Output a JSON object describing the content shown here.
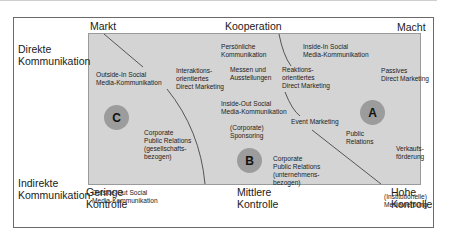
{
  "axes": {
    "top": [
      "Markt",
      "Kooperation",
      "Macht"
    ],
    "left": [
      "Direkte Kommunikation",
      "Indirekte Kommunikation"
    ],
    "bottom": [
      "Geringe Kontrolle",
      "Mittlere Kontrolle",
      "Hohe Kontrolle"
    ]
  },
  "clusters": [
    {
      "label": "C",
      "color": "#9c9c9c"
    },
    {
      "label": "B",
      "color": "#9c9c9c"
    },
    {
      "label": "A",
      "color": "#9c9c9c"
    }
  ],
  "items": [
    [
      "Outside-In Social",
      "Media-Kommunikation"
    ],
    [
      "Interaktions-",
      "orientiertes",
      "Direct Marketing"
    ],
    [
      "Persönliche",
      "Kommunikation"
    ],
    [
      "Messen und",
      "Ausstellungen"
    ],
    [
      "Reaktions-",
      "orientiertes",
      "Direct Marketing"
    ],
    [
      "Inside-In Social",
      "Media-Kommunikation"
    ],
    [
      "Passives",
      "Direct Marketing"
    ],
    [
      "Inside-Out Social",
      "Media-Kommunikation"
    ],
    [
      "(Corporate)",
      "Sponsoring"
    ],
    [
      "Event Marketing"
    ],
    [
      "Public",
      "Relations"
    ],
    [
      "Verkaufs-",
      "förderung"
    ],
    [
      "Corporate",
      "Public Relations",
      "(gesellschafts-",
      "bezogen)"
    ],
    [
      "Corporate",
      "Public Relations",
      "(unternehmens-",
      "bezogen)"
    ],
    [
      "Outside-Out Social",
      "Media-Kommunikation"
    ],
    [
      "(Institutionelle)",
      "Mediawerbung"
    ]
  ]
}
